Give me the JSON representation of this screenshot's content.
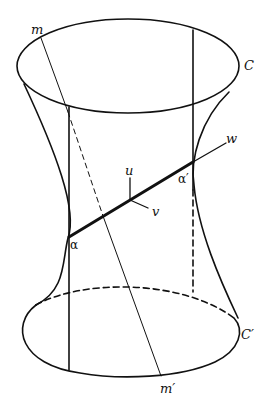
{
  "figure": {
    "labels": {
      "top_circle": "C",
      "bottom_circle": "C′",
      "line_top": "m",
      "line_bottom": "m′",
      "point_left": "α",
      "point_right": "α′",
      "axis_u": "u",
      "axis_v": "v",
      "axis_w": "w"
    },
    "colors": {
      "stroke": "#111111",
      "background": "#ffffff"
    }
  }
}
